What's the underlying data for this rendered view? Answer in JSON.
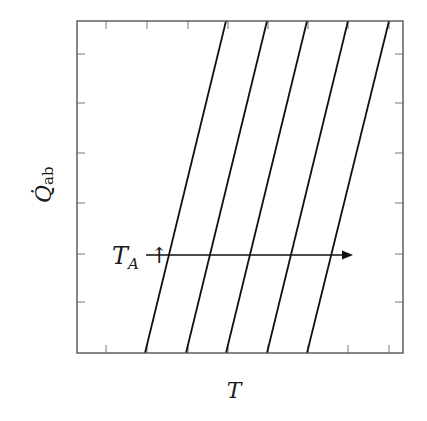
{
  "diagram": {
    "type": "line",
    "xlabel": "T",
    "ylabel": "Q̇",
    "ylabel_subscript": "ab",
    "annotation": {
      "label": "T",
      "label_subscript": "A",
      "arrow_glyph": "↑",
      "meaning": "T_A increasing"
    },
    "frame": {
      "left": 77,
      "top": 21,
      "right": 403,
      "bottom": 353
    },
    "ticks": {
      "x": [
        106,
        147,
        188,
        228,
        268,
        308,
        348,
        389
      ],
      "y": [
        54,
        103,
        153,
        203,
        254,
        302
      ]
    },
    "lines": [
      {
        "x_bottom": 145,
        "x_top": 226
      },
      {
        "x_bottom": 186,
        "x_top": 267
      },
      {
        "x_bottom": 226,
        "x_top": 307
      },
      {
        "x_bottom": 267,
        "x_top": 348
      },
      {
        "x_bottom": 307,
        "x_top": 389
      }
    ],
    "arrow": {
      "x_start": 146,
      "x_end": 353,
      "y": 255
    },
    "colors": {
      "frame": "#555555",
      "lines": "#111111",
      "ticks": "#777777"
    }
  },
  "chart_data": {
    "type": "line",
    "title": "",
    "xlabel": "T",
    "ylabel": "Q̇_ab",
    "series": [
      {
        "name": "T_A,1",
        "x": [
          0.21,
          0.46
        ],
        "y": [
          0,
          1
        ]
      },
      {
        "name": "T_A,2",
        "x": [
          0.33,
          0.58
        ],
        "y": [
          0,
          1
        ]
      },
      {
        "name": "T_A,3",
        "x": [
          0.46,
          0.71
        ],
        "y": [
          0,
          1
        ]
      },
      {
        "name": "T_A,4",
        "x": [
          0.58,
          0.83
        ],
        "y": [
          0,
          1
        ]
      },
      {
        "name": "T_A,5",
        "x": [
          0.71,
          0.96
        ],
        "y": [
          0,
          1
        ]
      }
    ],
    "annotations": [
      "T_A ↑ (arrow pointing right, increasing T_A shifts lines right)"
    ],
    "tick_labels": "none",
    "grid": false,
    "legend": "none"
  }
}
